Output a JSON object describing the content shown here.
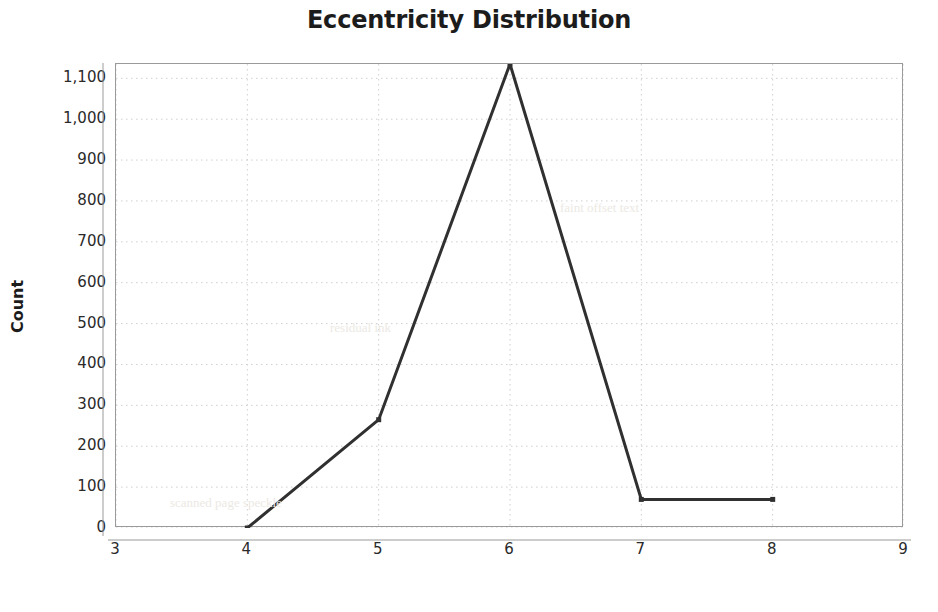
{
  "chart_data": {
    "type": "line",
    "title": "Eccentricity Distribution",
    "xlabel": "Value",
    "ylabel": "Count",
    "x": [
      4,
      5,
      6,
      7,
      8
    ],
    "values": [
      0,
      265,
      1135,
      70,
      70
    ],
    "series": [
      {
        "name": "Count",
        "x": [
          4,
          5,
          6,
          7,
          8
        ],
        "values": [
          0,
          265,
          1135,
          70,
          70
        ]
      }
    ],
    "xlim": [
      3,
      9
    ],
    "ylim": [
      0,
      1135
    ],
    "x_ticks": [
      3,
      4,
      5,
      6,
      7,
      8,
      9
    ],
    "x_tick_labels": [
      "3",
      "4",
      "5",
      "6",
      "7",
      "8",
      "9"
    ],
    "y_ticks": [
      0,
      100,
      200,
      300,
      400,
      500,
      600,
      700,
      800,
      900,
      1000,
      1100
    ],
    "y_tick_labels": [
      "0",
      "100",
      "200",
      "300",
      "400",
      "500",
      "600",
      "700",
      "800",
      "900",
      "1,000",
      "1,100"
    ],
    "grid": true,
    "grid_style": "dotted",
    "legend": false,
    "markers": "square",
    "line_color": "#303030",
    "grid_color": "#cfcfcf",
    "axis_color": "#9a9a9a",
    "background_color": "#ffffff"
  },
  "artifacts": [
    {
      "text": "scanned page speckle",
      "x": 170,
      "y": 495
    },
    {
      "text": "faint offset text",
      "x": 560,
      "y": 200
    },
    {
      "text": "residual ink",
      "x": 330,
      "y": 320
    }
  ]
}
